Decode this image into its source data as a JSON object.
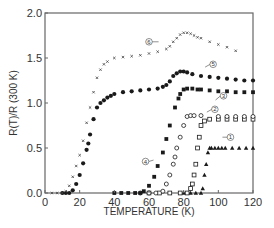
{
  "chart_data": {
    "type": "scatter",
    "title": "",
    "xlabel": "TEMPERATURE (K)",
    "ylabel": "R(T)/R (300 K)",
    "xlim": [
      0,
      120
    ],
    "ylim": [
      0.0,
      2.0
    ],
    "xticks": [
      0,
      20,
      40,
      60,
      80,
      100,
      120
    ],
    "yticks": [
      "0.0",
      "0.5",
      "1.0",
      "1.5",
      "2.0"
    ],
    "grid": false,
    "legend": "inline circled numbers",
    "series": [
      {
        "name": "1",
        "marker": "filled-triangle",
        "x": [
          80,
          84,
          87,
          90,
          91,
          92,
          93,
          94,
          95,
          96,
          98,
          100,
          102,
          104,
          108,
          112,
          116,
          120
        ],
        "y": [
          0,
          0,
          0,
          0,
          0.05,
          0.2,
          0.32,
          0.45,
          0.5,
          0.5,
          0.5,
          0.5,
          0.5,
          0.5,
          0.5,
          0.5,
          0.5,
          0.5
        ]
      },
      {
        "name": "2",
        "marker": "open-square",
        "x": [
          60,
          66,
          72,
          78,
          82,
          84,
          85,
          86,
          87,
          88,
          89,
          90,
          92,
          95,
          100,
          105,
          110,
          115,
          120
        ],
        "y": [
          0,
          0,
          0,
          0,
          0,
          0.05,
          0.1,
          0.2,
          0.32,
          0.5,
          0.62,
          0.75,
          0.8,
          0.82,
          0.82,
          0.82,
          0.82,
          0.82,
          0.82
        ]
      },
      {
        "name": "3",
        "marker": "open-circle",
        "x": [
          55,
          60,
          64,
          68,
          70,
          72,
          74,
          75,
          76,
          78,
          80,
          82,
          84,
          86,
          90,
          100,
          105,
          110,
          115,
          120
        ],
        "y": [
          0,
          0,
          0,
          0.02,
          0.1,
          0.2,
          0.32,
          0.4,
          0.5,
          0.62,
          0.75,
          0.85,
          0.86,
          0.86,
          0.86,
          0.85,
          0.85,
          0.85,
          0.85,
          0.85
        ]
      },
      {
        "name": "4",
        "marker": "filled-square",
        "x": [
          40,
          44,
          48,
          52,
          55,
          57,
          60,
          63,
          65,
          68,
          70,
          72,
          75,
          77,
          78,
          80,
          82,
          85,
          88,
          90,
          95,
          100,
          105,
          110,
          115,
          120
        ],
        "y": [
          0,
          0,
          0,
          0,
          0,
          0.02,
          0.08,
          0.18,
          0.3,
          0.45,
          0.6,
          0.75,
          0.95,
          1.05,
          1.1,
          1.15,
          1.16,
          1.16,
          1.15,
          1.15,
          1.14,
          1.13,
          1.13,
          1.12,
          1.12,
          1.12
        ]
      },
      {
        "name": "5",
        "marker": "filled-circle",
        "x": [
          10,
          12,
          14,
          16,
          18,
          20,
          22,
          24,
          25,
          26,
          28,
          30,
          32,
          34,
          36,
          38,
          40,
          45,
          50,
          55,
          60,
          65,
          68,
          70,
          72,
          74,
          76,
          78,
          80,
          82,
          85,
          90,
          95,
          100,
          105,
          110,
          115,
          120
        ],
        "y": [
          0,
          0,
          0,
          0.03,
          0.1,
          0.2,
          0.33,
          0.48,
          0.55,
          0.65,
          0.82,
          0.95,
          1.0,
          1.03,
          1.06,
          1.08,
          1.1,
          1.12,
          1.13,
          1.14,
          1.15,
          1.16,
          1.18,
          1.2,
          1.24,
          1.3,
          1.33,
          1.35,
          1.35,
          1.34,
          1.32,
          1.3,
          1.29,
          1.28,
          1.27,
          1.26,
          1.25,
          1.25
        ]
      },
      {
        "name": "6",
        "marker": "cross",
        "x": [
          4,
          7,
          10,
          12,
          14,
          16,
          18,
          20,
          22,
          24,
          26,
          28,
          30,
          32,
          34,
          36,
          40,
          45,
          50,
          55,
          60,
          65,
          70,
          72,
          74,
          76,
          78,
          80,
          82,
          84,
          86,
          88,
          90,
          95,
          100,
          105,
          110
        ],
        "y": [
          0,
          0,
          0,
          0.02,
          0.08,
          0.18,
          0.3,
          0.42,
          0.58,
          0.78,
          0.95,
          1.12,
          1.28,
          1.37,
          1.43,
          1.46,
          1.5,
          1.51,
          1.52,
          1.53,
          1.55,
          1.57,
          1.6,
          1.63,
          1.68,
          1.72,
          1.76,
          1.78,
          1.78,
          1.77,
          1.75,
          1.73,
          1.72,
          1.68,
          1.65,
          1.62,
          1.58
        ]
      }
    ],
    "annotations": [
      {
        "text": "1",
        "x": 107,
        "y": 0.62
      },
      {
        "text": "2",
        "x": 98,
        "y": 0.93
      },
      {
        "text": "3",
        "x": 103,
        "y": 1.08
      },
      {
        "text": "4",
        "x": 58,
        "y": 0.35
      },
      {
        "text": "5",
        "x": 97,
        "y": 1.43
      },
      {
        "text": "6",
        "x": 60,
        "y": 1.68
      }
    ]
  }
}
